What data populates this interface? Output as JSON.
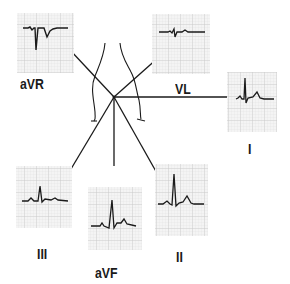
{
  "diagram": {
    "type": "ecg-hexaxial-limb-leads",
    "colors": {
      "line": "#1a1a1a",
      "grid_minor": "#dcdcdc",
      "grid_major": "#bdbdbd",
      "panel_bg": "#f4f4f4",
      "background": "#ffffff"
    },
    "center": {
      "x": 114,
      "y": 97
    },
    "leads": [
      {
        "id": "aVR",
        "label": "aVR",
        "panel": {
          "x": 17,
          "y": 13,
          "w": 57,
          "h": 60
        },
        "label_pos": {
          "x": 20,
          "y": 76
        },
        "axis_end": {
          "x": 70,
          "y": 50
        }
      },
      {
        "id": "VL",
        "label": "VL",
        "panel": {
          "x": 152,
          "y": 14,
          "w": 58,
          "h": 60
        },
        "label_pos": {
          "x": 176,
          "y": 81
        },
        "axis_end": {
          "x": 159,
          "y": 57
        }
      },
      {
        "id": "I",
        "label": "I",
        "panel": {
          "x": 227,
          "y": 72,
          "w": 50,
          "h": 60
        },
        "label_pos": {
          "x": 248,
          "y": 141
        },
        "axis_end": {
          "x": 236,
          "y": 97
        }
      },
      {
        "id": "III",
        "label": "III",
        "panel": {
          "x": 16,
          "y": 166,
          "w": 56,
          "h": 62
        },
        "label_pos": {
          "x": 37,
          "y": 246
        },
        "axis_end": {
          "x": 68,
          "y": 174
        }
      },
      {
        "id": "aVF",
        "label": "aVF",
        "panel": {
          "x": 88,
          "y": 187,
          "w": 54,
          "h": 63
        },
        "label_pos": {
          "x": 96,
          "y": 265
        },
        "axis_end": {
          "x": 114,
          "y": 166
        }
      },
      {
        "id": "II",
        "label": "II",
        "panel": {
          "x": 155,
          "y": 164,
          "w": 53,
          "h": 72
        },
        "label_pos": {
          "x": 176,
          "y": 249
        },
        "axis_end": {
          "x": 158,
          "y": 175
        }
      }
    ]
  }
}
